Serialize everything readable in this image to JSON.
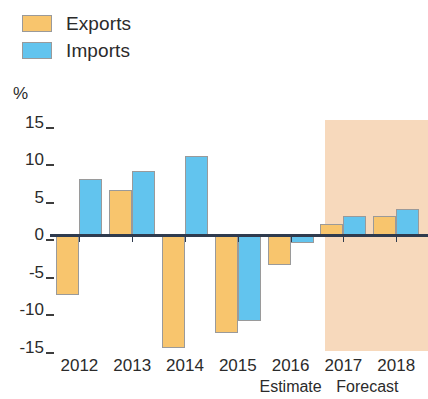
{
  "legend": {
    "items": [
      {
        "label": "Exports",
        "color": "#f8c56d",
        "icon": "legend-swatch-icon"
      },
      {
        "label": "Imports",
        "color": "#62c4ee",
        "icon": "legend-swatch-icon"
      }
    ]
  },
  "axis_unit": "%",
  "annotations": [
    {
      "label": "Estimate",
      "under": "2016"
    },
    {
      "label": "Forecast",
      "under": "2017"
    }
  ],
  "forecast_band_color": "#f7d9bc",
  "chart_data": {
    "type": "bar",
    "title": "",
    "xlabel": "",
    "ylabel": "%",
    "categories": [
      "2012",
      "2013",
      "2014",
      "2015",
      "2016",
      "2017",
      "2018"
    ],
    "series": [
      {
        "name": "Exports",
        "color": "#f8c56d",
        "values": [
          -8,
          6,
          -15,
          -13,
          -4,
          1.5,
          2.5
        ]
      },
      {
        "name": "Imports",
        "color": "#62c4ee",
        "values": [
          7.5,
          8.5,
          10.5,
          -11.5,
          -1,
          2.5,
          3.5
        ]
      }
    ],
    "ylim": [
      -15,
      15
    ],
    "yticks": [
      15,
      10,
      5,
      0,
      -5,
      -10,
      -15
    ],
    "ytick_labels": [
      "15",
      "10",
      "5",
      "0",
      "-5",
      "-10",
      "-15"
    ],
    "grid": false,
    "legend_position": "top-left",
    "forecast_start_category": "2017",
    "estimate_category": "2016"
  }
}
